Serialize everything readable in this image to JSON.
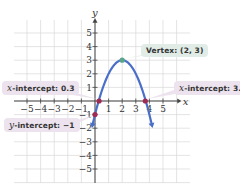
{
  "chart_data": {
    "type": "line",
    "title": "",
    "xlabel": "x",
    "ylabel": "y",
    "xlim": [
      -6,
      6.5
    ],
    "ylim": [
      -6,
      6
    ],
    "grid": true,
    "x_ticks": [
      -5,
      -4,
      -3,
      -2,
      -1,
      1,
      2,
      3,
      4,
      5
    ],
    "y_ticks": [
      5,
      4,
      3,
      2,
      1,
      -1,
      -2,
      -3,
      -4,
      -5
    ],
    "series": [
      {
        "name": "parabola",
        "equation": "y = -(x - 2)^2 + 3",
        "color": "#4a6fc9",
        "vertex": [
          2,
          3
        ],
        "x_intercepts": [
          0.3,
          3.7
        ],
        "y_intercept": -1
      }
    ],
    "points": [
      {
        "x": 2,
        "y": 3,
        "color": "#5aa58a"
      },
      {
        "x": 0.3,
        "y": 0,
        "color": "#9e2b55"
      },
      {
        "x": 3.7,
        "y": 0,
        "color": "#9e2b55"
      },
      {
        "x": 0,
        "y": -1,
        "color": "#9e2b55"
      }
    ],
    "annotations": [
      {
        "id": "vertex",
        "text_prefix": "Vertex: ",
        "text_value": "(2, 3)"
      },
      {
        "id": "x_int_left",
        "var": "x",
        "text_prefix": "-intercept: ",
        "text_value": "0.3"
      },
      {
        "id": "x_int_right",
        "var": "x",
        "text_prefix": "-intercept: ",
        "text_value": "3.7"
      },
      {
        "id": "y_int",
        "var": "y",
        "text_prefix": "-intercept: ",
        "text_value": "−1"
      }
    ]
  },
  "labels": {
    "vertex": "Vertex: (2, 3)",
    "x_int_left_var": "x",
    "x_int_left_text": "-intercept: 0.3",
    "x_int_right_var": "x",
    "x_int_right_text": "-intercept: 3.7",
    "y_int_var": "y",
    "y_int_text": "-intercept: −1",
    "x_axis": "x",
    "y_axis": "y"
  }
}
